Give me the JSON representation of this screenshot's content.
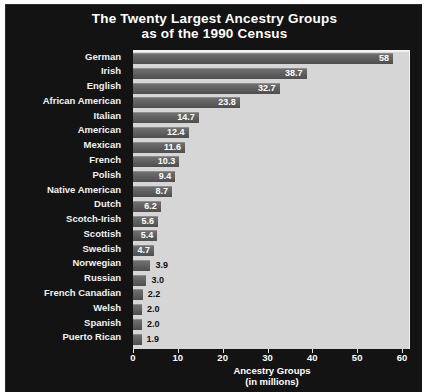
{
  "chart_data": {
    "type": "bar",
    "orientation": "horizontal",
    "title_line1": "The Twenty Largest Ancestry Groups",
    "title_line2": "as of the 1990 Census",
    "xlabel_line1": "Ancestry Groups",
    "xlabel_line2": "(in millions)",
    "ylabel": "",
    "xlim": [
      0,
      60
    ],
    "xticks": [
      0,
      10,
      20,
      30,
      40,
      50,
      60
    ],
    "xtick_labels": [
      "0",
      "10",
      "20",
      "30",
      "40",
      "50",
      "60"
    ],
    "grid": false,
    "legend": null,
    "categories": [
      "German",
      "Irish",
      "English",
      "African American",
      "Italian",
      "American",
      "Mexican",
      "French",
      "Polish",
      "Native American",
      "Dutch",
      "Scotch-Irish",
      "Scottish",
      "Swedish",
      "Norwegian",
      "Russian",
      "French Canadian",
      "Welsh",
      "Spanish",
      "Puerto Rican"
    ],
    "values": [
      58,
      38.7,
      32.7,
      23.8,
      14.7,
      12.4,
      11.6,
      10.3,
      9.4,
      8.7,
      6.2,
      5.6,
      5.4,
      4.7,
      3.9,
      3.0,
      2.2,
      2.0,
      2.0,
      1.9
    ],
    "value_labels": [
      "58",
      "38.7",
      "32.7",
      "23.8",
      "14.7",
      "12.4",
      "11.6",
      "10.3",
      "9.4",
      "8.7",
      "6.2",
      "5.6",
      "5.4",
      "4.7",
      "3.9",
      "3.0",
      "2.2",
      "2.0",
      "2.0",
      "1.9"
    ],
    "label_placement": [
      "inside",
      "inside",
      "inside",
      "inside",
      "inside",
      "inside",
      "inside",
      "inside",
      "inside",
      "inside",
      "inside",
      "inside",
      "inside",
      "inside",
      "outside",
      "outside",
      "outside",
      "outside",
      "outside",
      "outside"
    ],
    "colors": {
      "panel_background": "#131313",
      "plot_background": "#d6d6d6",
      "bar_fill": "#606060",
      "bar_highlight": "#8d8d8d",
      "bar_shadow": "#0d0d0d",
      "text_light": "#ffffff",
      "text_dark": "#111111"
    }
  }
}
